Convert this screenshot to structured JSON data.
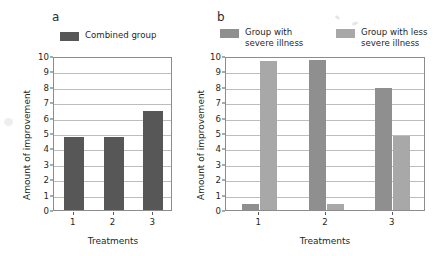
{
  "chart_data": [
    {
      "type": "bar",
      "panel": "a",
      "title": "",
      "xlabel": "Treatments",
      "ylabel": "Amount of improvement",
      "categories": [
        "1",
        "2",
        "3"
      ],
      "ylim": [
        0,
        10
      ],
      "yticks": [
        0,
        1,
        2,
        3,
        4,
        5,
        6,
        7,
        8,
        9,
        10
      ],
      "grid": true,
      "legend_position": "top",
      "series": [
        {
          "name": "Combined group",
          "color": "#575757",
          "values": [
            4.75,
            4.75,
            6.4
          ]
        }
      ]
    },
    {
      "type": "bar",
      "panel": "b",
      "title": "",
      "xlabel": "Treatments",
      "ylabel": "Amount of improvement",
      "categories": [
        "1",
        "2",
        "3"
      ],
      "ylim": [
        0,
        10
      ],
      "yticks": [
        0,
        1,
        2,
        3,
        4,
        5,
        6,
        7,
        8,
        9,
        10
      ],
      "grid": true,
      "legend_position": "top",
      "series": [
        {
          "name": "Group with severe illness",
          "color": "#8f8f8f",
          "values": [
            0.4,
            9.75,
            7.9
          ]
        },
        {
          "name": "Group with less severe illness",
          "color": "#a8a8a8",
          "values": [
            9.7,
            0.4,
            4.8
          ]
        }
      ]
    }
  ],
  "panels": {
    "a": {
      "letter": "a",
      "legend": [
        {
          "label": "Combined group",
          "color": "#575757"
        }
      ],
      "axis": {
        "ylabel": "Amount of improvement",
        "xlabel": "Treatments",
        "yticks": [
          "10",
          "9",
          "8",
          "7",
          "6",
          "5",
          "4",
          "3",
          "2",
          "1",
          "0"
        ],
        "xticks": [
          "1",
          "2",
          "3"
        ]
      }
    },
    "b": {
      "letter": "b",
      "legend": [
        {
          "label": "Group with\nsevere illness",
          "color": "#8f8f8f"
        },
        {
          "label": "Group with less\nsevere illness",
          "color": "#a8a8a8"
        }
      ],
      "axis": {
        "ylabel": "Amount of improvement",
        "xlabel": "Treatments",
        "yticks": [
          "10",
          "9",
          "8",
          "7",
          "6",
          "5",
          "4",
          "3",
          "2",
          "1",
          "0"
        ],
        "xticks": [
          "1",
          "2",
          "3"
        ]
      }
    }
  }
}
